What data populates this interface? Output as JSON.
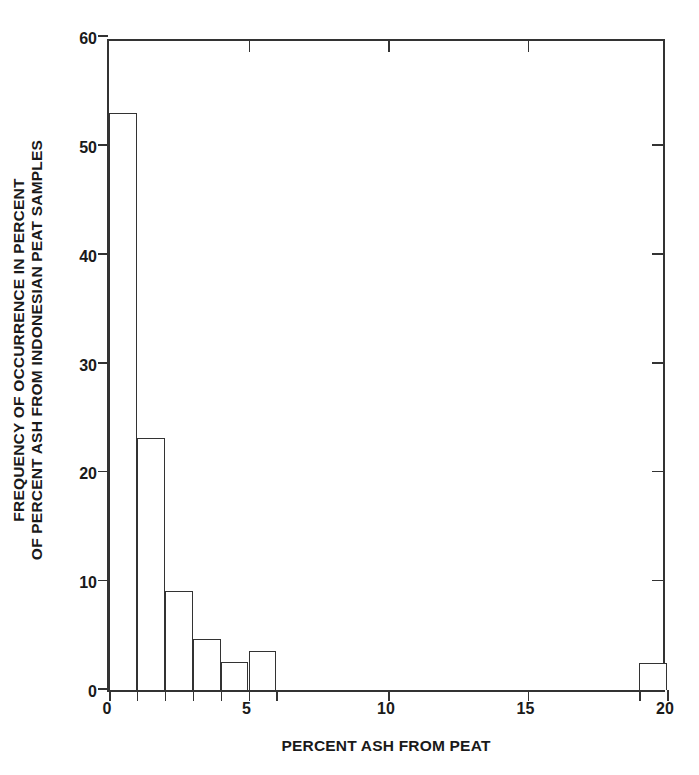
{
  "chart_data": {
    "type": "bar",
    "title": "",
    "xlabel": "PERCENT ASH FROM PEAT",
    "ylabel": "FREQUENCY OF OCCURRENCE IN PERCENT OF PERCENT ASH FROM INDONESIAN PEAT SAMPLES",
    "ylabel_lines": [
      "FREQUENCY OF OCCURRENCE IN PERCENT",
      "OF PERCENT ASH FROM INDONESIAN PEAT SAMPLES"
    ],
    "xlim": [
      0,
      20
    ],
    "ylim": [
      0,
      60
    ],
    "grid": false,
    "legend": null,
    "bin_width": 1,
    "categories": [
      "0-1",
      "1-2",
      "2-3",
      "3-4",
      "4-5",
      "5-6",
      "19-20"
    ],
    "values": [
      53,
      23.2,
      9.1,
      4.7,
      2.6,
      3.6,
      2.5
    ],
    "bars": [
      {
        "x_start": 0,
        "x_end": 1,
        "value": 53
      },
      {
        "x_start": 1,
        "x_end": 2,
        "value": 23.2
      },
      {
        "x_start": 2,
        "x_end": 3,
        "value": 9.1
      },
      {
        "x_start": 3,
        "x_end": 4,
        "value": 4.7
      },
      {
        "x_start": 4,
        "x_end": 5,
        "value": 2.6
      },
      {
        "x_start": 5,
        "x_end": 6,
        "value": 3.6
      },
      {
        "x_start": 19,
        "x_end": 20,
        "value": 2.5
      }
    ],
    "x_ticks_labeled": [
      {
        "value": 0,
        "label": "0"
      },
      {
        "value": 5,
        "label": "5"
      },
      {
        "value": 10,
        "label": "10"
      },
      {
        "value": 15,
        "label": "15"
      },
      {
        "value": 20,
        "label": "20"
      }
    ],
    "x_ticks_minor": [
      0,
      1,
      2,
      3,
      4,
      5,
      6,
      10,
      15,
      19,
      20
    ],
    "x_ticks_top": [
      5,
      10,
      15
    ],
    "y_ticks": [
      {
        "value": 0,
        "label": "0"
      },
      {
        "value": 10,
        "label": "10"
      },
      {
        "value": 20,
        "label": "20"
      },
      {
        "value": 30,
        "label": "30"
      },
      {
        "value": 40,
        "label": "40"
      },
      {
        "value": 50,
        "label": "50"
      },
      {
        "value": 60,
        "label": "60"
      }
    ],
    "y_ticks_right": [
      10,
      20,
      30,
      40,
      50
    ],
    "colors": {
      "axis": "#333333",
      "bar_fill": "#ffffff",
      "bar_edge": "#333333",
      "text": "#1a1a1a",
      "background": "#ffffff"
    }
  }
}
